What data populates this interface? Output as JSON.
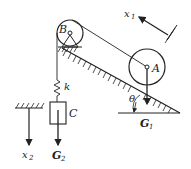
{
  "diagram": {
    "labels": {
      "pulley": "B",
      "wheel": "A",
      "spring": "k",
      "block": "C",
      "coord1": "x",
      "coord1_sub": "1",
      "coord2": "x",
      "coord2_sub": "2",
      "weight1": "G",
      "weight1_sub": "1",
      "weight2": "G",
      "weight2_sub": "2",
      "angle": "θ"
    },
    "colors": {
      "stroke": "#222222",
      "background": "#ffffff"
    }
  }
}
